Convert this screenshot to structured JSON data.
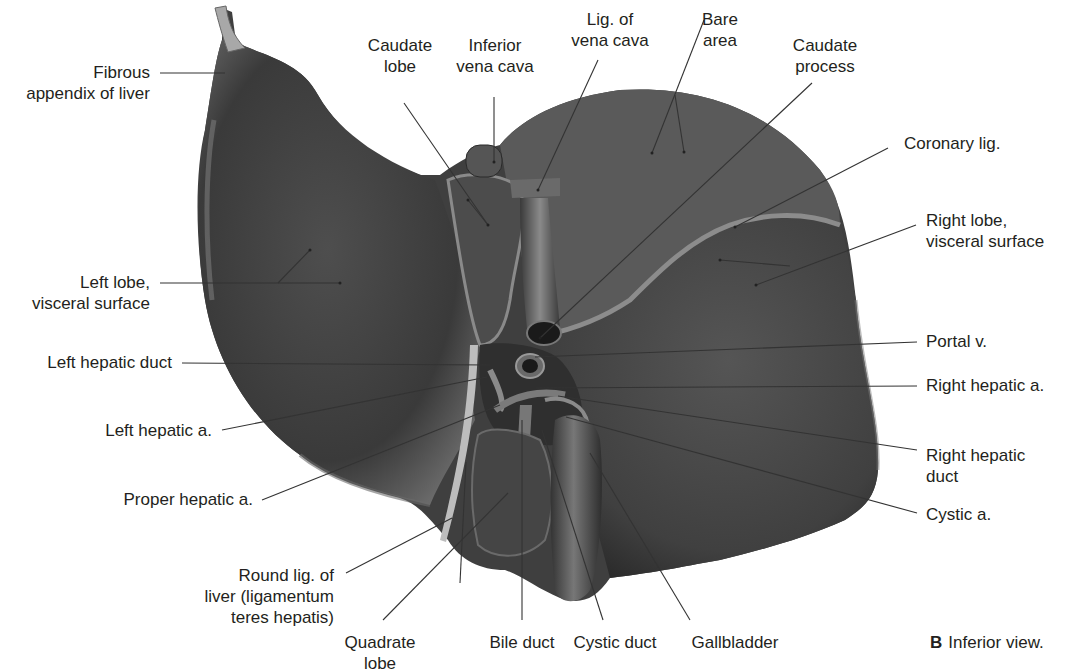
{
  "figure": {
    "caption_letter": "B",
    "caption_text": "Inferior view.",
    "colors": {
      "organ": "#4a4a4a",
      "organ_dark": "#2a2a2a",
      "highlight": "#9a9a9a",
      "leader_line": "#333333",
      "text": "#231f20"
    }
  },
  "labels": {
    "fibrous_appendix": "Fibrous\nappendix of liver",
    "caudate_lobe": "Caudate\nlobe",
    "inferior_vena_cava": "Inferior\nvena cava",
    "lig_vena_cava": "Lig. of\nvena cava",
    "bare_area": "Bare\narea",
    "caudate_process": "Caudate\nprocess",
    "coronary_lig": "Coronary lig.",
    "right_lobe": "Right lobe,\nvisceral surface",
    "left_lobe": "Left lobe,\nvisceral surface",
    "left_hepatic_duct": "Left hepatic duct",
    "portal_v": "Portal v.",
    "right_hepatic_a": "Right hepatic a.",
    "left_hepatic_a": "Left hepatic a.",
    "right_hepatic_duct": "Right hepatic\nduct",
    "proper_hepatic_a": "Proper hepatic a.",
    "cystic_a": "Cystic a.",
    "round_lig": "Round lig. of\nliver (ligamentum\nteres hepatis)",
    "quadrate_lobe": "Quadrate\nlobe",
    "bile_duct": "Bile duct",
    "cystic_duct": "Cystic duct",
    "gallbladder": "Gallbladder"
  }
}
